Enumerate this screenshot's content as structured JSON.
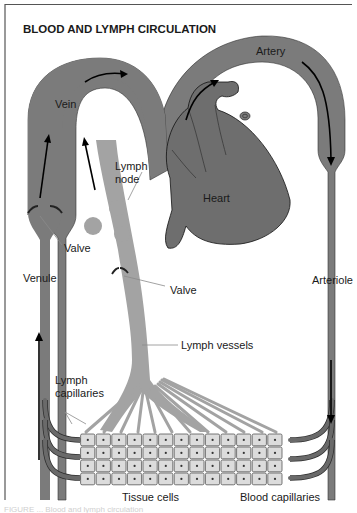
{
  "figure": {
    "title": "BLOOD AND LYMPH CIRCULATION",
    "caption": "FIGURE ... Blood and lymph circulation",
    "colors": {
      "blood_vessel": "#7b7b7b",
      "lymph_vessel": "#a3a3a3",
      "heart": "#6e6e6e",
      "tissue_cell": "#dcdcdc",
      "border": "#555555"
    }
  },
  "labels": {
    "vein": "Vein",
    "artery": "Artery",
    "heart": "Heart",
    "lymph_node_line1": "Lymph",
    "lymph_node_line2": "node",
    "valve_venule": "Valve",
    "valve_lymph": "Valve",
    "venule": "Venule",
    "arteriole": "Arteriole",
    "lymph_vessels": "Lymph vessels",
    "lymph_capillaries_line1": "Lymph",
    "lymph_capillaries_line2": "capillaries",
    "tissue_cells": "Tissue cells",
    "blood_capillaries": "Blood capillaries"
  },
  "tissue_grid": {
    "rows": 4,
    "columns": 13
  },
  "flow_arrows": [
    {
      "location": "vein-top",
      "direction": "right"
    },
    {
      "location": "artery-left",
      "direction": "up-right"
    },
    {
      "location": "artery-right",
      "direction": "down"
    },
    {
      "location": "arteriole",
      "direction": "down"
    },
    {
      "location": "venule",
      "direction": "up"
    },
    {
      "location": "vein-left",
      "direction": "up"
    },
    {
      "location": "lymph-trunk",
      "direction": "up"
    }
  ]
}
